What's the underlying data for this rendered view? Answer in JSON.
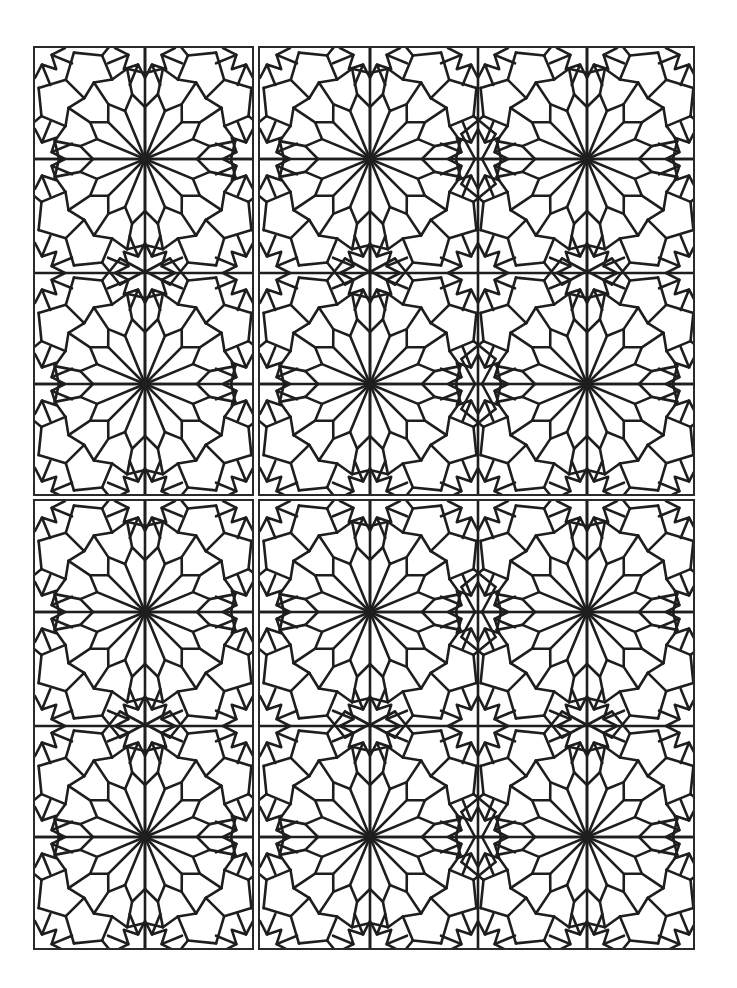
{
  "colors": {
    "line": "#1e1e1e",
    "background": "#ffffff",
    "border": "#2a2a2a"
  },
  "pattern": {
    "type": "16-point rosette girih",
    "tile_width": 220,
    "tile_height": 225,
    "rays": 16,
    "stroke_width": 2.6
  },
  "panels": [
    {
      "name": "panel-top-left",
      "x": 33,
      "y": 46,
      "w": 221,
      "h": 450,
      "centers": [
        [
          110,
          111
        ],
        [
          110,
          336
        ]
      ]
    },
    {
      "name": "panel-top-right",
      "x": 258,
      "y": 46,
      "w": 437,
      "h": 450,
      "centers": [
        [
          110,
          111
        ],
        [
          327,
          111
        ],
        [
          110,
          336
        ],
        [
          327,
          336
        ]
      ]
    },
    {
      "name": "panel-bottom-left",
      "x": 33,
      "y": 499,
      "w": 221,
      "h": 451,
      "centers": [
        [
          110,
          111
        ],
        [
          110,
          336
        ]
      ]
    },
    {
      "name": "panel-bottom-right",
      "x": 258,
      "y": 499,
      "w": 437,
      "h": 451,
      "centers": [
        [
          110,
          111
        ],
        [
          327,
          111
        ],
        [
          110,
          336
        ],
        [
          327,
          336
        ]
      ]
    }
  ]
}
